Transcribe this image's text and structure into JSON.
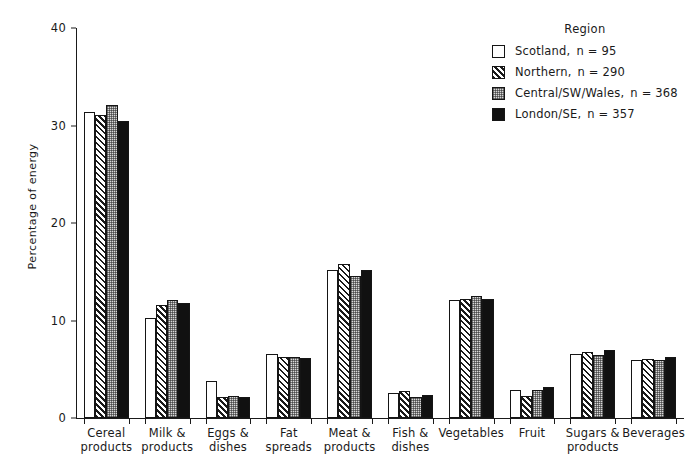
{
  "chart_data": {
    "type": "bar",
    "title": "",
    "xlabel": "",
    "ylabel": "Percentage of energy",
    "ylim": [
      0,
      40
    ],
    "yticks": [
      0,
      10,
      20,
      30,
      40
    ],
    "grid": false,
    "legend_position": "top-right",
    "legend_title": "Region",
    "categories": [
      "Cereal products",
      "Milk & products",
      "Eggs & dishes",
      "Fat spreads",
      "Meat & products",
      "Fish & dishes",
      "Vegetables",
      "Fruit",
      "Sugars & products",
      "Beverages"
    ],
    "category_lines": [
      [
        "Cereal",
        "products"
      ],
      [
        "Milk &",
        "products"
      ],
      [
        "Eggs &",
        "dishes"
      ],
      [
        "Fat",
        "spreads"
      ],
      [
        "Meat &",
        "products"
      ],
      [
        "Fish &",
        "dishes"
      ],
      [
        "Vegetables",
        ""
      ],
      [
        "Fruit",
        ""
      ],
      [
        "Sugars &",
        "products"
      ],
      [
        "Beverages",
        ""
      ]
    ],
    "series": [
      {
        "name": "Scotland",
        "n": 95,
        "legend_label": "Scotland,",
        "n_label": "n = 95",
        "pattern": "open-white",
        "values": [
          31.4,
          10.3,
          3.8,
          6.6,
          15.2,
          2.6,
          12.1,
          2.9,
          6.6,
          6.0
        ]
      },
      {
        "name": "Northern",
        "n": 290,
        "legend_label": "Northern,",
        "n_label": "n = 290",
        "pattern": "diagonal-hatch",
        "values": [
          31.1,
          11.6,
          2.2,
          6.3,
          15.8,
          2.8,
          12.2,
          2.3,
          6.8,
          6.1
        ]
      },
      {
        "name": "Central/SW/Wales",
        "n": 368,
        "legend_label": "Central/SW/Wales,",
        "n_label": "n = 368",
        "pattern": "stipple-grey",
        "values": [
          32.1,
          12.1,
          2.3,
          6.3,
          14.6,
          2.2,
          12.5,
          2.9,
          6.5,
          5.9
        ]
      },
      {
        "name": "London/SE",
        "n": 357,
        "legend_label": "London/SE,",
        "n_label": "n = 357",
        "pattern": "solid-black",
        "values": [
          30.5,
          11.8,
          2.2,
          6.2,
          15.2,
          2.4,
          12.2,
          3.2,
          7.0,
          6.3
        ]
      }
    ]
  },
  "colors": {
    "axis": "#1a1a1a",
    "scotland": "#ffffff",
    "northern": "#ffffff",
    "central": "#d8d8d8",
    "london": "#111111",
    "background": "#ffffff"
  }
}
